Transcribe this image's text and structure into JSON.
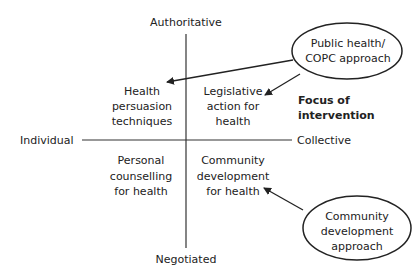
{
  "axes": {
    "top": "Authoritative",
    "bottom": "Negotiated",
    "left": "Individual",
    "right": "Collective"
  },
  "quadrants": {
    "top_left": [
      "Health",
      "persuasion",
      "techniques"
    ],
    "top_right": [
      "Legislative",
      "action for",
      "health"
    ],
    "bottom_left": [
      "Personal",
      "counselling",
      "for health"
    ],
    "bottom_right": [
      "Community",
      "development",
      "for health"
    ]
  },
  "focus_label": [
    "Focus of",
    "intervention"
  ],
  "approaches": {
    "public_health": [
      "Public health/",
      "COPC approach"
    ],
    "community_dev": [
      "Community",
      "development",
      "approach"
    ]
  },
  "colors": {
    "line": "#333333",
    "text": "#222222",
    "background": "#ffffff"
  }
}
